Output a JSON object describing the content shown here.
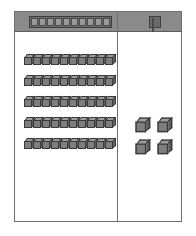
{
  "app": {
    "title": "Base-Ten Blocks Place Value Mat",
    "background_color": "#ffffff"
  },
  "mat": {
    "border_color": "#6f6f6f",
    "fill_color": "#ffffff",
    "header_color": "#8a8a8a",
    "divider_color": "#6f6f6f"
  },
  "columns": [
    {
      "id": "tens",
      "header": {
        "icon": "ten-rod-icon",
        "label": "",
        "pip_count": 10
      },
      "rows": [
        {
          "cube_count": 10
        },
        {
          "cube_count": 10
        },
        {
          "cube_count": 10
        },
        {
          "cube_count": 10
        },
        {
          "cube_count": 10
        }
      ],
      "row_count": 5,
      "total": 50
    },
    {
      "id": "ones",
      "header": {
        "icon": "unit-cube-icon",
        "label": "",
        "pip_count": 1
      },
      "loose_cubes": 4,
      "total": 4
    }
  ],
  "cube_style": {
    "front_color": "#7e7e7e",
    "top_color": "#9d9d9d",
    "side_color": "#5f5f5f",
    "edge_color": "#3a3a3a"
  }
}
